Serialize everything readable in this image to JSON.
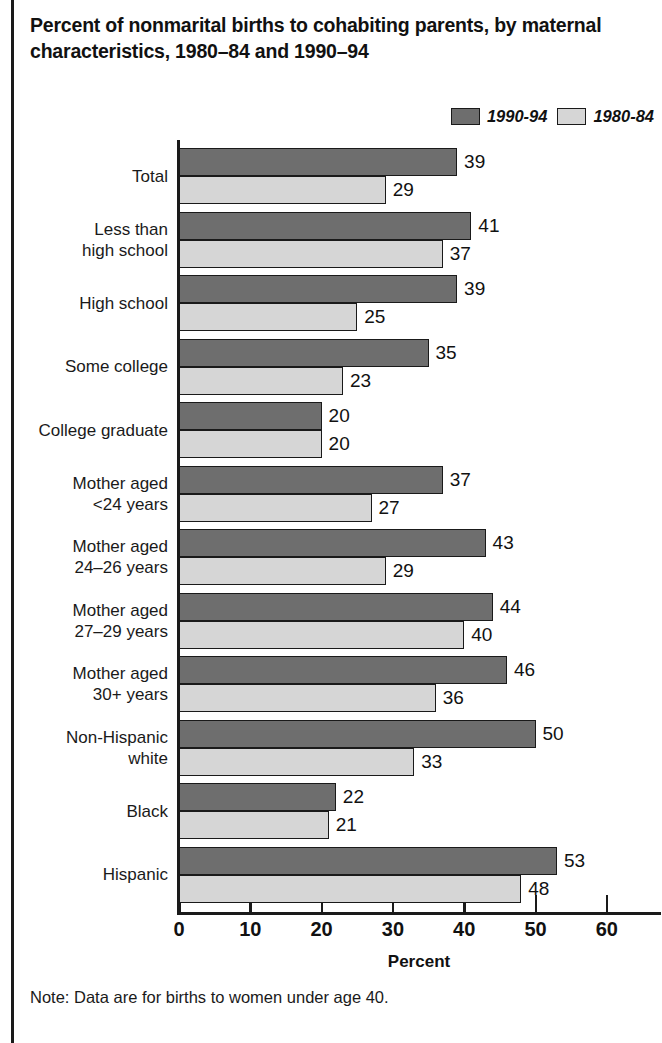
{
  "figure": {
    "title": "Percent of nonmarital births to cohabiting parents, by maternal characteristics, 1980–84 and 1990–94",
    "note": "Note: Data are for births to women under age 40."
  },
  "legend": {
    "position": "top-right",
    "entries": [
      {
        "label": "1990-94",
        "swatch": "dark-gray-swatch-icon",
        "color": "#6e6e6e"
      },
      {
        "label": "1980-84",
        "swatch": "light-gray-swatch-icon",
        "color": "#d6d6d6"
      }
    ]
  },
  "chart_data": {
    "type": "bar",
    "orientation": "horizontal",
    "title": "Percent of nonmarital births to cohabiting parents, by maternal characteristics, 1980–84 and 1990–94",
    "xlabel": "Percent",
    "ylabel": "",
    "xlim": [
      0,
      68
    ],
    "xticks": [
      0,
      10,
      20,
      30,
      40,
      50,
      60
    ],
    "xticklabels": [
      "0",
      "10",
      "20",
      "30",
      "40",
      "50",
      "60"
    ],
    "grid": false,
    "legend_position": "top-right",
    "categories": [
      "Total",
      "Less than high school",
      "High school",
      "Some college",
      "College graduate",
      "Mother aged <24 years",
      "Mother aged 24–26 years",
      "Mother aged 27–29 years",
      "Mother aged 30+ years",
      "Non-Hispanic white",
      "Black",
      "Hispanic"
    ],
    "category_label_lines": [
      [
        "Total"
      ],
      [
        "Less than",
        "high school"
      ],
      [
        "High school"
      ],
      [
        "Some college"
      ],
      [
        "College graduate"
      ],
      [
        "Mother aged",
        "<24 years"
      ],
      [
        "Mother aged",
        "24–26 years"
      ],
      [
        "Mother aged",
        "27–29 years"
      ],
      [
        "Mother aged",
        "30+ years"
      ],
      [
        "Non-Hispanic",
        "white"
      ],
      [
        "Black"
      ],
      [
        "Hispanic"
      ]
    ],
    "series": [
      {
        "name": "1990-94",
        "color": "#6e6e6e",
        "values": [
          39,
          41,
          39,
          35,
          20,
          37,
          43,
          44,
          46,
          50,
          22,
          53
        ]
      },
      {
        "name": "1980-84",
        "color": "#d6d6d6",
        "values": [
          29,
          37,
          25,
          23,
          20,
          27,
          29,
          40,
          36,
          33,
          21,
          48
        ]
      }
    ],
    "annotations": [
      "Note: Data are for births to women under age 40."
    ]
  }
}
